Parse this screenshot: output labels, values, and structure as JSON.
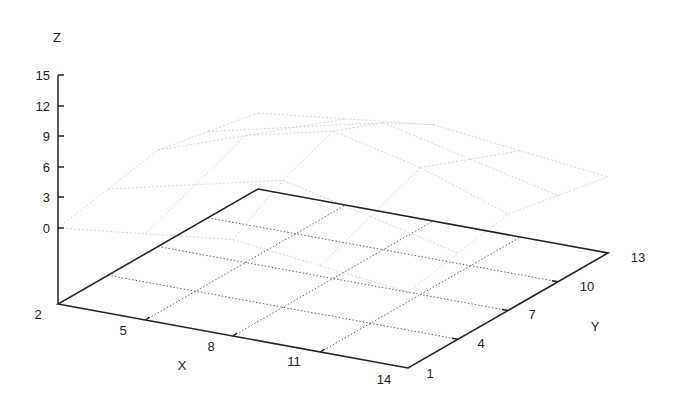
{
  "chart_data": {
    "type": "surface3d",
    "title": "",
    "xlabel": "X",
    "ylabel": "Y",
    "zlabel": "Z",
    "x_ticks": [
      2,
      5,
      8,
      11,
      14
    ],
    "y_ticks": [
      1,
      4,
      7,
      10,
      13
    ],
    "z_ticks": [
      0,
      3,
      6,
      9,
      12,
      15
    ],
    "xlim": [
      2,
      14
    ],
    "ylim": [
      1,
      13
    ],
    "zlim": [
      0,
      15
    ],
    "grid": true,
    "base_grid": "dotted 4x4",
    "surface": {
      "style": "faint wireframe",
      "color": "#dddddd",
      "x": [
        2,
        5,
        8,
        11,
        14
      ],
      "y": [
        1,
        4,
        7,
        10,
        13
      ],
      "z": [
        [
          0,
          1,
          2,
          1,
          0
        ],
        [
          1,
          3,
          5,
          3,
          1
        ],
        [
          2,
          5,
          7,
          5,
          2
        ],
        [
          1,
          3,
          5,
          3,
          1
        ],
        [
          0,
          1,
          2,
          1,
          0
        ]
      ]
    }
  },
  "labels": {
    "x_title": "X",
    "y_title": "Y",
    "z_title": "Z",
    "x_ticks": [
      "2",
      "5",
      "8",
      "11",
      "14"
    ],
    "y_ticks": [
      "1",
      "4",
      "7",
      "10",
      "13"
    ],
    "z_ticks": [
      "15",
      "12",
      "9",
      "6",
      "3",
      "0"
    ]
  },
  "colors": {
    "axis": "#222222",
    "grid": "#555555",
    "surface": "#d8d8d8"
  }
}
